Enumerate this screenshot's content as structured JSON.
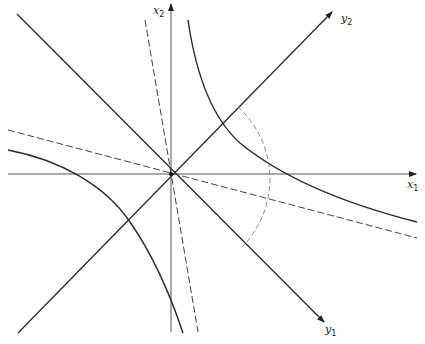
{
  "diagram": {
    "type": "coordinate-rotation-hyperbola",
    "colors": {
      "line": "#2a2a2a",
      "axis": "#555555",
      "dashed": "#444444",
      "background": "#ffffff"
    },
    "origin": [
      171,
      174
    ],
    "axes": {
      "x1": {
        "label": "x",
        "subscript": "1",
        "from": [
          8,
          174
        ],
        "to": [
          416,
          174
        ]
      },
      "x2": {
        "label": "x",
        "subscript": "2",
        "from": [
          171,
          332
        ],
        "to": [
          171,
          4
        ]
      },
      "y1": {
        "label": "y",
        "subscript": "1",
        "from": [
          17,
          14
        ],
        "to": [
          324,
          322
        ]
      },
      "y2": {
        "label": "y",
        "subscript": "2",
        "from": [
          18,
          333
        ],
        "to": [
          332,
          12
        ]
      }
    },
    "dashed_lines": [
      {
        "name": "asymptote-steep",
        "from": [
          145,
          20
        ],
        "to": [
          198,
          332
        ]
      },
      {
        "name": "asymptote-shallow",
        "from": [
          8,
          130
        ],
        "to": [
          417,
          238
        ]
      }
    ],
    "hyperbola_branches": [
      {
        "name": "upper-right",
        "path": "M188,20 Q205,100 240,145 T417,222"
      },
      {
        "name": "lower-left",
        "path": "M8,150 Q95,165 130,222 T183,333"
      }
    ],
    "arc": {
      "center": [
        171,
        174
      ],
      "radius": 98,
      "from": [
        238,
        107
      ],
      "to": [
        242,
        247
      ]
    }
  }
}
